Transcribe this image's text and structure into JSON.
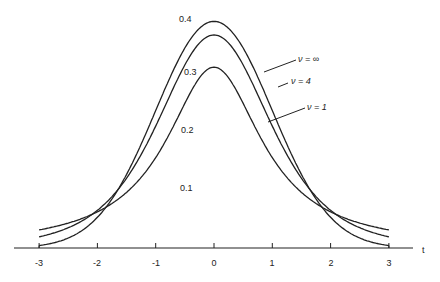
{
  "chart_data": {
    "type": "line",
    "title": "",
    "xlabel": "t",
    "ylabel": "",
    "xlim": [
      -3,
      3
    ],
    "ylim": [
      0,
      0.4
    ],
    "grid": false,
    "x_ticks": [
      "-3",
      "-2",
      "-1",
      "0",
      "1",
      "2",
      "3"
    ],
    "y_ticks": [
      "0.1",
      "0.2",
      "0.3",
      "0.4"
    ],
    "series": [
      {
        "name": "ν = ∞",
        "peak": 0.399,
        "description": "standard normal density"
      },
      {
        "name": "ν = 4",
        "peak": 0.375,
        "description": "Student t density, 4 d.f."
      },
      {
        "name": "ν = 1",
        "peak": 0.318,
        "description": "Student t density, 1 d.f. (Cauchy)"
      }
    ],
    "legend_position": "annotations right of curves"
  },
  "labels": {
    "y01": "0.1",
    "y02": "0.2",
    "y03": "0.3",
    "y04": "0.4",
    "x_axis": "t",
    "leg_inf": "ν = ∞",
    "leg_4": "ν = 4",
    "leg_1": "ν = 1"
  }
}
